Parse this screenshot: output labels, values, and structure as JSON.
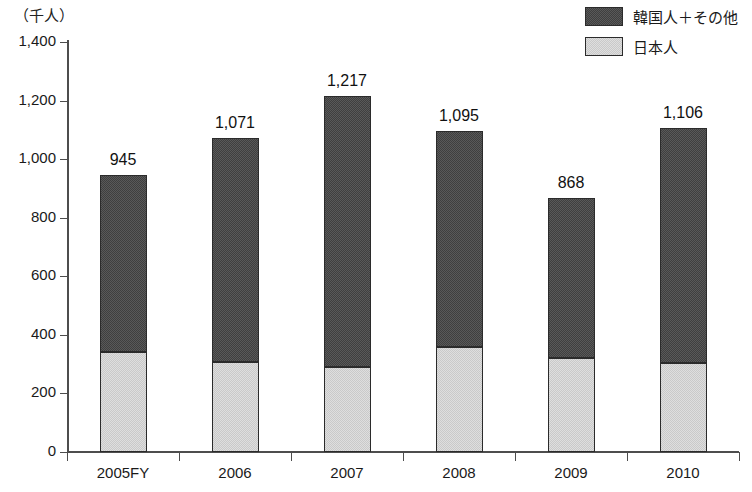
{
  "axis_unit_caption": "（千人）",
  "legend": {
    "position": "top-right",
    "items": [
      {
        "label": "韓国人＋その他",
        "swatch": "dark-gray-swatch",
        "color": "#595959"
      },
      {
        "label": "日本人",
        "swatch": "light-gray-swatch",
        "color": "#dedede"
      }
    ]
  },
  "chart_data": {
    "type": "bar",
    "stacked": true,
    "title": "",
    "subtitle": "",
    "xlabel": "",
    "ylabel": "（千人）",
    "categories": [
      "2005FY",
      "2006",
      "2007",
      "2008",
      "2009",
      "2010"
    ],
    "series": [
      {
        "name": "日本人",
        "values": [
          341,
          308,
          290,
          358,
          320,
          305
        ],
        "color": "#dedede",
        "stack_order": 1
      },
      {
        "name": "韓国人＋その他",
        "values": [
          604,
          763,
          927,
          737,
          548,
          801
        ],
        "color": "#595959",
        "stack_order": 2
      }
    ],
    "totals": [
      945,
      1071,
      1217,
      1095,
      868,
      1106
    ],
    "total_labels": [
      "945",
      "1,071",
      "1,217",
      "1,095",
      "868",
      "1,106"
    ],
    "ylim": [
      0,
      1400
    ],
    "yticks": [
      0,
      200,
      400,
      600,
      800,
      1000,
      1200,
      1400
    ],
    "ytick_labels": [
      "0",
      "200",
      "400",
      "600",
      "800",
      "1,000",
      "1,200",
      "1,400"
    ],
    "grid": false,
    "legend_position": "top-right"
  }
}
